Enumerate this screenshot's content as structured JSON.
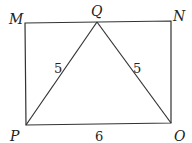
{
  "diagram": {
    "points": {
      "M": {
        "label": "M",
        "x": 25,
        "y": 23
      },
      "Q": {
        "label": "Q",
        "x": 97,
        "y": 22
      },
      "N": {
        "label": "N",
        "x": 171,
        "y": 21
      },
      "P": {
        "label": "P",
        "x": 26,
        "y": 125
      },
      "O": {
        "label": "O",
        "x": 171,
        "y": 123
      }
    },
    "segment_labels": {
      "PQ": "5",
      "QO": "5",
      "PO": "6"
    },
    "stroke_color": "#333333"
  }
}
